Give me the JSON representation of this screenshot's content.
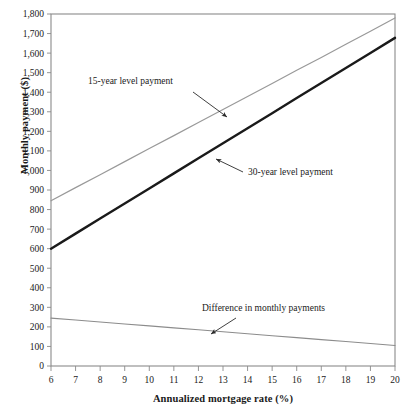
{
  "chart_data": {
    "type": "line",
    "title": "",
    "xlabel": "Annualized mortgage rate (%)",
    "ylabel": "Monthly payment ($)",
    "xlim": [
      6,
      20
    ],
    "ylim": [
      0,
      1800
    ],
    "grid": false,
    "legend_position": "none",
    "x_ticks": [
      "6",
      "7",
      "8",
      "9",
      "10",
      "11",
      "12",
      "13",
      "14",
      "15",
      "16",
      "17",
      "18",
      "19",
      "20"
    ],
    "x_tick_values": [
      6,
      7,
      8,
      9,
      10,
      11,
      12,
      13,
      14,
      15,
      16,
      17,
      18,
      19,
      20
    ],
    "y_ticks": [
      "0",
      "100",
      "200",
      "300",
      "400",
      "500",
      "600",
      "700",
      "800",
      "900",
      "1,000",
      "1,100",
      "1,200",
      "1,300",
      "1,400",
      "1,500",
      "1,600",
      "1,700",
      "1,800"
    ],
    "y_tick_values": [
      0,
      100,
      200,
      300,
      400,
      500,
      600,
      700,
      800,
      900,
      1000,
      1100,
      1200,
      1300,
      1400,
      1500,
      1600,
      1700,
      1800
    ],
    "x": [
      6,
      7,
      8,
      9,
      10,
      11,
      12,
      13,
      14,
      15,
      16,
      17,
      18,
      19,
      20
    ],
    "series": [
      {
        "name": "15-year level payment",
        "color": "#999999",
        "width": 1.2,
        "values": [
          845,
          912,
          978,
          1045,
          1112,
          1178,
          1245,
          1312,
          1378,
          1445,
          1512,
          1578,
          1645,
          1712,
          1780
        ]
      },
      {
        "name": "30-year level payment",
        "color": "#1a1a1a",
        "width": 2.4,
        "values": [
          600,
          677,
          754,
          831,
          908,
          985,
          1062,
          1139,
          1216,
          1293,
          1370,
          1447,
          1524,
          1601,
          1678
        ]
      },
      {
        "name": "Difference in monthly payments",
        "color": "#8c8c8c",
        "width": 1.1,
        "values": [
          245,
          235,
          225,
          215,
          205,
          195,
          185,
          175,
          165,
          155,
          145,
          135,
          125,
          115,
          105
        ]
      }
    ],
    "annotations": [
      {
        "name": "15-year level payment",
        "text": "15-year level payment",
        "text_x": 88,
        "text_y": 84,
        "arrow_from_x": 193,
        "arrow_from_y": 92,
        "arrow_to_x": 227,
        "arrow_to_y": 117
      },
      {
        "name": "30-year level payment",
        "text": "30-year level payment",
        "text_x": 248,
        "text_y": 175,
        "arrow_from_x": 243,
        "arrow_from_y": 172,
        "arrow_to_x": 216,
        "arrow_to_y": 159
      },
      {
        "name": "Difference in monthly payments",
        "text": "Difference in monthly payments",
        "text_x": 202,
        "text_y": 311,
        "arrow_from_x": 236,
        "arrow_from_y": 318,
        "arrow_to_x": 211,
        "arrow_to_y": 334
      }
    ]
  }
}
